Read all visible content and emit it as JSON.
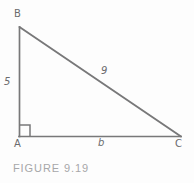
{
  "figure": {
    "caption": "FIGURE 9.19",
    "shape": "right-triangle",
    "stroke_color": "#787879",
    "label_color": "#6b6b6d",
    "caption_color": "#a7a7a9",
    "background_color": "#fdfdfd",
    "vertices": {
      "a": "A",
      "b": "B",
      "c": "C"
    },
    "sides": {
      "ab": "5",
      "bc": "9",
      "ac": "b"
    },
    "right_angle_at": "A"
  }
}
